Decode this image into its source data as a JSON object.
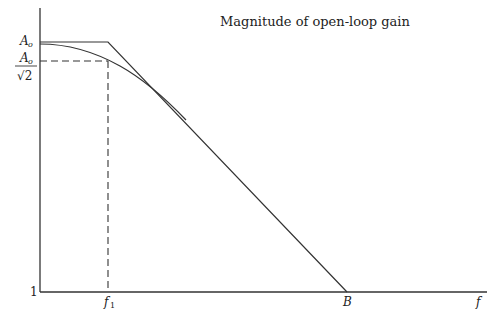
{
  "diagram": {
    "title": "Magnitude of open-loop gain",
    "y_labels": {
      "top": "A",
      "top_sub": "o",
      "half_num": "A",
      "half_num_sub": "o",
      "half_den": "√2",
      "bottom": "1"
    },
    "x_labels": {
      "f1": "f",
      "f1_sub": "1",
      "B": "B",
      "axis": "f"
    },
    "curves": [
      {
        "name": "asymptote",
        "description": "flat at A_o until f1, then falls linearly to 1 at B"
      },
      {
        "name": "actual-response",
        "description": "smooth curve passing through A_o/√2 at f1, merging with asymptote"
      }
    ],
    "guides": [
      {
        "name": "dashed-horizontal",
        "description": "A_o/√2 level to f1"
      },
      {
        "name": "dashed-vertical",
        "description": "f1 down to axis"
      }
    ]
  }
}
